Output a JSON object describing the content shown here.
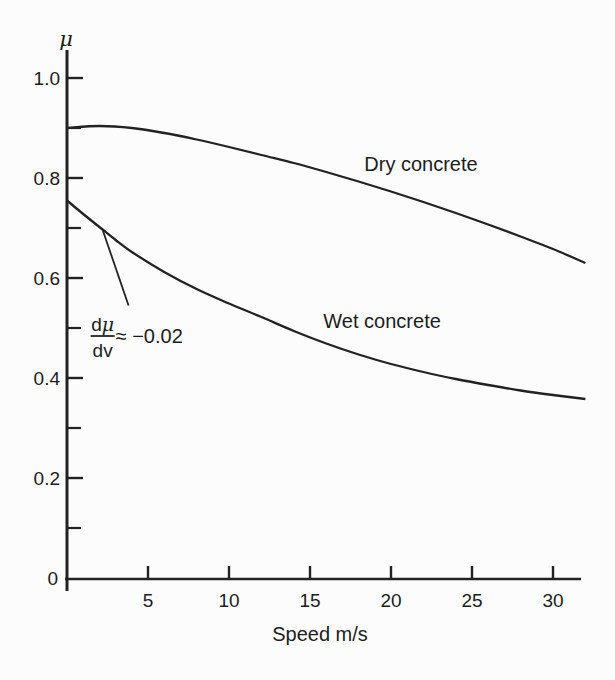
{
  "figure": {
    "background": "#fcfcfc",
    "ink_color": "#222222"
  },
  "chart_data": {
    "type": "line",
    "title": "",
    "xlabel": "Speed m/s",
    "ylabel": "μ",
    "xlim": [
      0,
      32
    ],
    "ylim": [
      0,
      1.05
    ],
    "grid": false,
    "legend_position": "inline-labels",
    "x_ticks": [
      5,
      10,
      15,
      20,
      25,
      30
    ],
    "x_tick_labels": [
      "5",
      "10",
      "15",
      "20",
      "25",
      "30"
    ],
    "y_ticks_major": [
      0.2,
      0.4,
      0.6,
      0.8,
      1.0
    ],
    "y_tick_labels": [
      "0.2",
      "0.4",
      "0.6",
      "0.8",
      "1.0"
    ],
    "y_ticks_minor": [
      0.1,
      0.3,
      0.5,
      0.7,
      0.9
    ],
    "origin_label": "0",
    "series": [
      {
        "name": "Dry concrete",
        "x": [
          0,
          2,
          4,
          6,
          8,
          10,
          12,
          14,
          16,
          18,
          20,
          22,
          24,
          26,
          28,
          30,
          32
        ],
        "y": [
          0.9,
          0.904,
          0.9,
          0.89,
          0.877,
          0.862,
          0.846,
          0.83,
          0.812,
          0.793,
          0.773,
          0.752,
          0.73,
          0.707,
          0.683,
          0.658,
          0.63
        ],
        "label_at": {
          "v": 21.85,
          "mu": 0.814
        }
      },
      {
        "name": "Wet concrete",
        "x": [
          0,
          1,
          2,
          3,
          4,
          6,
          8,
          10,
          12,
          14,
          16,
          18,
          20,
          22,
          24,
          26,
          28,
          30,
          32
        ],
        "y": [
          0.755,
          0.728,
          0.702,
          0.676,
          0.652,
          0.612,
          0.578,
          0.549,
          0.522,
          0.494,
          0.469,
          0.447,
          0.428,
          0.412,
          0.398,
          0.386,
          0.375,
          0.366,
          0.358
        ],
        "label_at": {
          "v": 19.45,
          "mu": 0.5
        }
      }
    ],
    "annotation": {
      "numerator_roman": "d",
      "numerator_symbol": "μ",
      "denominator": "dv",
      "value_text": "≈ −0.02",
      "fraction_center": {
        "v": 2.2,
        "mu": 0.484
      },
      "pointer_from": {
        "v": 2.16,
        "mu": 0.7
      },
      "pointer_to": {
        "v": 3.8,
        "mu": 0.545
      }
    }
  }
}
